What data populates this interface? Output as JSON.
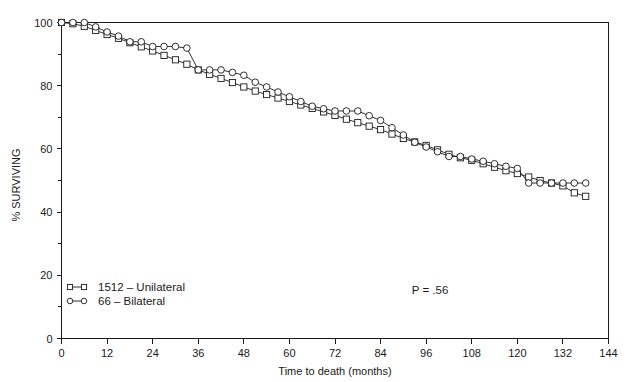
{
  "chart_data": {
    "type": "line",
    "title": "",
    "subtitle": "",
    "xlabel": "Time to death (months)",
    "ylabel": "% SURVIVING",
    "xlim": [
      0,
      144
    ],
    "ylim": [
      0,
      100
    ],
    "grid": false,
    "legend_position": "lower-left-inside",
    "x_ticks": [
      0,
      12,
      24,
      36,
      48,
      60,
      72,
      84,
      96,
      108,
      120,
      132,
      144
    ],
    "x_tick_labels": [
      "0",
      "12",
      "24",
      "36",
      "48",
      "60",
      "72",
      "84",
      "96",
      "108",
      "120",
      "132",
      "144"
    ],
    "y_ticks": [
      0,
      20,
      40,
      60,
      80,
      100
    ],
    "y_tick_labels": [
      "0",
      "20",
      "40",
      "60",
      "80",
      "100"
    ],
    "y_minor_ticks": [
      10,
      30,
      50,
      70,
      90
    ],
    "annotations": [
      {
        "name": "p-value",
        "text": "P = .56",
        "x": 86,
        "y": 13
      }
    ],
    "series": [
      {
        "name": "1512 - Unilateral",
        "legend_label": "1512 – Unilateral",
        "marker": "square",
        "count": 1512,
        "laterality": "Unilateral",
        "x": [
          0,
          3,
          6,
          9,
          12,
          15,
          18,
          21,
          24,
          27,
          30,
          33,
          36,
          39,
          42,
          45,
          48,
          51,
          54,
          57,
          60,
          63,
          66,
          69,
          72,
          75,
          78,
          81,
          84,
          87,
          90,
          93,
          96,
          99,
          102,
          105,
          108,
          111,
          114,
          117,
          120,
          123,
          126,
          129,
          132,
          135,
          138
        ],
        "values": [
          100,
          99.6,
          98.8,
          97.5,
          96.2,
          95.0,
          93.6,
          92.3,
          91.0,
          89.6,
          88.2,
          86.8,
          85.0,
          83.6,
          82.3,
          81.0,
          79.6,
          78.3,
          77.2,
          76.1,
          75.0,
          73.9,
          72.8,
          71.7,
          70.6,
          69.4,
          68.3,
          67.2,
          66.1,
          64.7,
          63.3,
          62.2,
          61.1,
          59.7,
          58.3,
          57.2,
          56.4,
          55.3,
          54.2,
          53.1,
          52.2,
          51.1,
          50.0,
          49.2,
          48.3,
          46.1,
          45.0
        ]
      },
      {
        "name": "66 - Bilateral",
        "legend_label": "66 – Bilateral",
        "marker": "circle",
        "count": 66,
        "laterality": "Bilateral",
        "x": [
          0,
          3,
          6,
          9,
          12,
          15,
          18,
          21,
          24,
          27,
          30,
          33,
          36,
          39,
          42,
          45,
          48,
          51,
          54,
          57,
          60,
          63,
          66,
          69,
          72,
          75,
          78,
          81,
          84,
          87,
          90,
          93,
          96,
          99,
          102,
          105,
          108,
          111,
          114,
          117,
          120,
          123,
          126,
          129,
          132,
          135,
          138
        ],
        "values": [
          100,
          100,
          100,
          98.6,
          97.0,
          95.7,
          93.9,
          93.9,
          92.4,
          92.4,
          92.4,
          91.9,
          85.0,
          85.0,
          85.0,
          84.2,
          83.3,
          81.1,
          79.6,
          78.0,
          76.5,
          75.0,
          73.5,
          72.7,
          72.0,
          72.0,
          72.0,
          70.5,
          69.0,
          66.7,
          64.4,
          62.1,
          60.6,
          59.1,
          57.6,
          57.6,
          56.8,
          56.1,
          55.3,
          54.5,
          53.8,
          49.2,
          49.2,
          49.2,
          49.2,
          49.2,
          49.2
        ]
      }
    ]
  },
  "axes": {
    "y_title": "% SURVIVING",
    "x_title": "Time to death (months)"
  },
  "legend": {
    "entries": [
      {
        "label": "1512 – Unilateral",
        "marker": "square"
      },
      {
        "label": "66 – Bilateral",
        "marker": "circle"
      }
    ]
  },
  "pvalue": {
    "text": "P = .56"
  }
}
